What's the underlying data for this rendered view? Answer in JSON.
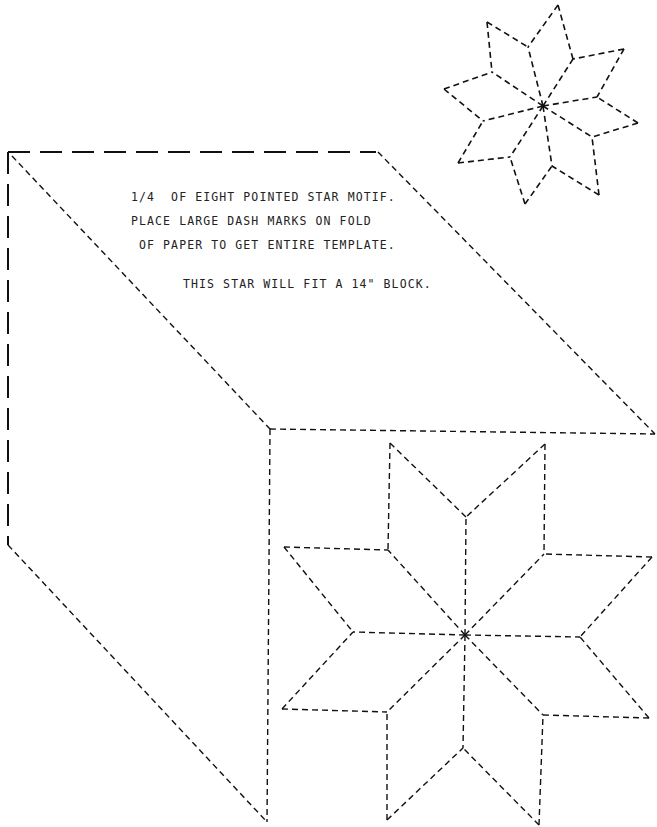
{
  "diagram": {
    "stroke_color": "#111111",
    "background": "#ffffff"
  },
  "instructions": {
    "line1": "1/4  OF EIGHT POINTED STAR MOTIF.",
    "line2": "PLACE LARGE DASH MARKS ON FOLD",
    "line3": " OF PAPER TO GET ENTIRE TEMPLATE.",
    "line4": "THIS STAR WILL FIT A 14\" BLOCK."
  },
  "template_outline": {
    "fold_edges": {
      "label": "large dash fold marks",
      "top": [
        [
          8,
          152
        ],
        [
          376,
          152
        ]
      ],
      "left": [
        [
          8,
          152
        ],
        [
          8,
          545
        ]
      ]
    },
    "cut_edges": {
      "top_diagonal": [
        [
          378,
          152
        ],
        [
          655,
          434
        ]
      ],
      "inner_horizontal": [
        [
          270,
          429
        ],
        [
          655,
          434
        ]
      ],
      "inner_diagonal": [
        [
          12,
          156
        ],
        [
          270,
          429
        ]
      ],
      "vertical": [
        [
          270,
          429
        ],
        [
          267,
          822
        ]
      ],
      "bottom_diagonal": [
        [
          8,
          545
        ],
        [
          267,
          822
        ]
      ]
    }
  },
  "small_star": {
    "center": [
      543,
      106
    ],
    "outer_points": [
      [
        558,
        5
      ],
      [
        624,
        49
      ],
      [
        638,
        123
      ],
      [
        599,
        195
      ],
      [
        525,
        204
      ],
      [
        458,
        163
      ],
      [
        444,
        89
      ],
      [
        487,
        22
      ]
    ],
    "inner_vertices": [
      [
        573,
        59
      ],
      [
        597,
        97
      ],
      [
        592,
        137
      ],
      [
        552,
        166
      ],
      [
        510,
        157
      ],
      [
        483,
        121
      ],
      [
        492,
        72
      ],
      [
        528,
        47
      ]
    ]
  },
  "large_star": {
    "center": [
      465,
      635
    ],
    "outer_points": [
      [
        545,
        444
      ],
      [
        652,
        557
      ],
      [
        649,
        718
      ],
      [
        539,
        825
      ],
      [
        387,
        820
      ],
      [
        282,
        709
      ],
      [
        284,
        547
      ],
      [
        390,
        443
      ]
    ],
    "inner_vertices": [
      [
        544,
        554
      ],
      [
        580,
        637
      ],
      [
        543,
        715
      ],
      [
        463,
        748
      ],
      [
        387,
        712
      ],
      [
        353,
        632
      ],
      [
        388,
        550
      ],
      [
        466,
        517
      ]
    ]
  }
}
